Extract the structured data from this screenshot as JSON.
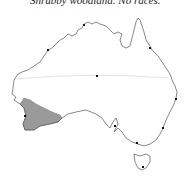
{
  "caption": "Shrubby woodland. No races.",
  "map": {
    "region": "Australia",
    "range_color": "#9a9a9a",
    "coast_color": "#555555",
    "tropic_color": "#dcdcdc",
    "range_area": "South-west Western Australia",
    "markers": [
      {
        "name": "alice-springs",
        "x": 97,
        "y": 76
      },
      {
        "name": "darwin",
        "x": 84,
        "y": 25
      },
      {
        "name": "broome",
        "x": 48,
        "y": 50
      },
      {
        "name": "cairns",
        "x": 150,
        "y": 48
      },
      {
        "name": "brisbane",
        "x": 176,
        "y": 99
      },
      {
        "name": "sydney",
        "x": 163,
        "y": 128
      },
      {
        "name": "melbourne",
        "x": 137,
        "y": 143
      },
      {
        "name": "adelaide",
        "x": 115,
        "y": 126
      },
      {
        "name": "hobart",
        "x": 143,
        "y": 167
      },
      {
        "name": "perth",
        "x": 25,
        "y": 116
      }
    ]
  }
}
